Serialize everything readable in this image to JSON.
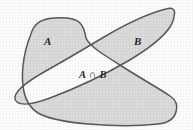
{
  "figure": {
    "type": "venn-diagram",
    "background_color": "#fefefe",
    "region_fill_color": "#dcdcdc",
    "outline_color": "#5a5a5a",
    "label_color": "#2a2a2a",
    "intersection_fill_color": "#ffffff"
  },
  "labels": {
    "set_a": "A",
    "set_b": "B",
    "intersection": "A ∩ B"
  },
  "regions": [
    {
      "name": "set-a-region",
      "label": "A",
      "shaded": true
    },
    {
      "name": "set-b-region",
      "label": "B",
      "shaded": true
    },
    {
      "name": "intersection-region",
      "label": "A ∩ B",
      "shaded": false
    }
  ],
  "shapes": {
    "set_a_path": "M 31 34 C 34 24, 40 19, 54 18 C 68 17, 76 19, 80 23 C 84 27, 85 32, 86 38 C 89 46, 104 55, 120 65 C 140 78, 160 89, 170 96 C 176 100, 178 106, 176 112 C 174 119, 168 123, 158 124 C 140 126, 112 126, 88 124 C 66 122, 48 119, 38 113 C 30 108, 26 101, 24 92 C 21 78, 22 56, 31 34 Z",
    "set_b_path": "M 174 16 C 176 10, 173 7, 166 9 C 150 13, 126 24, 104 37 C 84 49, 62 62, 44 72 C 30 80, 22 86, 18 91 C 14 96, 14 100, 17 102 C 22 106, 34 104, 50 98 C 74 89, 104 75, 128 61 C 150 48, 164 36, 170 27 C 173 22, 174 19, 174 16 Z"
  }
}
